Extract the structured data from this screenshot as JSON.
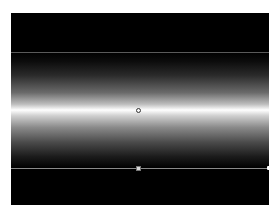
{
  "canvas": {
    "background": "#000000",
    "gradient": {
      "type": "linear",
      "direction": "vertical",
      "center_color": "#ffffff",
      "edge_color": "#000000"
    }
  },
  "handles": {
    "center": {
      "shape": "circle"
    },
    "stop": {
      "shape": "square"
    },
    "edge": {
      "shape": "dot"
    }
  },
  "faint_text": ""
}
